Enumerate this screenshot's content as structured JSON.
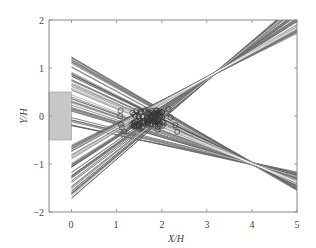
{
  "chart_data": {
    "type": "line",
    "title": "",
    "xlabel": "X/H",
    "ylabel": "Y/H",
    "xlim": [
      -0.5,
      5
    ],
    "ylim": [
      -2,
      2
    ],
    "xticks": [
      0,
      1,
      2,
      3,
      4,
      5
    ],
    "yticks": [
      -2,
      -1,
      0,
      1,
      2
    ],
    "grid": false,
    "legend": null,
    "annotations": [
      {
        "type": "rectangle",
        "description": "gray source slot",
        "x0": -0.5,
        "x1": 0,
        "y0": -0.5,
        "y1": 0.5,
        "color": "#c8c8c8"
      }
    ],
    "series": [
      {
        "name": "descending ray bundle",
        "description": "Many straight rays starting at X=0 between Y≈-0.2 and Y≈1.3, converging near X≈1.7, ending at X=5 between Y≈-1.5 and Y≈-1.2",
        "start_x": 0,
        "start_y_range": [
          -0.2,
          1.3
        ],
        "end_x": 5,
        "end_y_range": [
          -1.55,
          -1.2
        ],
        "count": 60,
        "color": "#555555"
      },
      {
        "name": "ascending ray bundle",
        "description": "Many straight rays starting at X=0 between Y≈-1.75 and Y≈-0.6, converging near X≈1.7, ending near X=5, Y≈2",
        "start_x": 0,
        "start_y_range": [
          -1.75,
          -0.6
        ],
        "end_x": 5,
        "end_y_range": [
          1.75,
          2.4
        ],
        "count": 60,
        "color": "#8a8a8a"
      },
      {
        "name": "intersection points",
        "type": "scatter",
        "marker": "circle",
        "description": "Cluster of hollow circle markers at ray intersections, centered near (1.7, -0.05)",
        "center": [
          1.7,
          -0.05
        ],
        "x_range": [
          0.95,
          2.35
        ],
        "y_range": [
          -0.35,
          0.2
        ],
        "color": "#333333"
      }
    ]
  },
  "axes": {
    "xlabel": "X/H",
    "ylabel": "Y/H",
    "xtick_labels": [
      "0",
      "1",
      "2",
      "3",
      "4",
      "5"
    ],
    "ytick_labels": [
      "2",
      "1",
      "0",
      "−1",
      "−2"
    ]
  }
}
